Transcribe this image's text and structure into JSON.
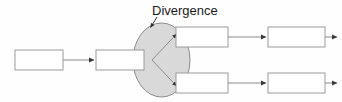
{
  "diagram": {
    "type": "process-flow-divergence",
    "background_color": "#fefefe",
    "annotation": {
      "label": "Divergence",
      "x": 152,
      "y": 15,
      "leader_from": [
        157,
        17
      ],
      "leader_to": [
        150,
        28
      ]
    },
    "ellipse": {
      "name": "divergence-node",
      "cx": 161.5,
      "cy": 60,
      "rx": 28.5,
      "ry": 37,
      "fill": "#d9d9d9",
      "stroke": "#8c8c8c"
    },
    "boxes": [
      {
        "id": "box-input-start",
        "x": 15,
        "y": 50,
        "w": 48,
        "h": 20,
        "fill": "#ffffff",
        "stroke": "#9a9a9a",
        "label": ""
      },
      {
        "id": "box-input-second",
        "x": 96,
        "y": 50,
        "w": 48,
        "h": 20,
        "fill": "#ffffff",
        "stroke": "#9a9a9a",
        "label": ""
      },
      {
        "id": "box-branch-top-first",
        "x": 176,
        "y": 27,
        "w": 52,
        "h": 20,
        "fill": "#ffffff",
        "stroke": "#9a9a9a",
        "label": ""
      },
      {
        "id": "box-branch-top-second",
        "x": 268,
        "y": 27,
        "w": 57,
        "h": 20,
        "fill": "#ffffff",
        "stroke": "#9a9a9a",
        "label": ""
      },
      {
        "id": "box-branch-bottom-first",
        "x": 176,
        "y": 73,
        "w": 52,
        "h": 20,
        "fill": "#ffffff",
        "stroke": "#9a9a9a",
        "label": ""
      },
      {
        "id": "box-branch-bottom-second",
        "x": 268,
        "y": 73,
        "w": 57,
        "h": 20,
        "fill": "#ffffff",
        "stroke": "#9a9a9a",
        "label": ""
      }
    ],
    "connectors": [
      {
        "id": "arrow-start-to-second",
        "from": [
          63,
          60
        ],
        "to": [
          95,
          60
        ],
        "stroke": "#8c8c8c"
      },
      {
        "id": "arrow-diverge-upper",
        "from": [
          152,
          60
        ],
        "to": [
          177,
          34
        ],
        "stroke": "#8c8c8c"
      },
      {
        "id": "arrow-diverge-lower",
        "from": [
          152,
          60
        ],
        "to": [
          177,
          86
        ],
        "stroke": "#8c8c8c"
      },
      {
        "id": "arrow-top-first-to-second",
        "from": [
          228,
          37
        ],
        "to": [
          267,
          37
        ],
        "stroke": "#8c8c8c"
      },
      {
        "id": "arrow-top-exit",
        "from": [
          325,
          37
        ],
        "to": [
          338,
          37
        ],
        "stroke": "#8c8c8c"
      },
      {
        "id": "arrow-bottom-first-to-second",
        "from": [
          228,
          83
        ],
        "to": [
          267,
          83
        ],
        "stroke": "#8c8c8c"
      },
      {
        "id": "arrow-bottom-exit",
        "from": [
          325,
          83
        ],
        "to": [
          338,
          83
        ],
        "stroke": "#8c8c8c"
      }
    ]
  }
}
